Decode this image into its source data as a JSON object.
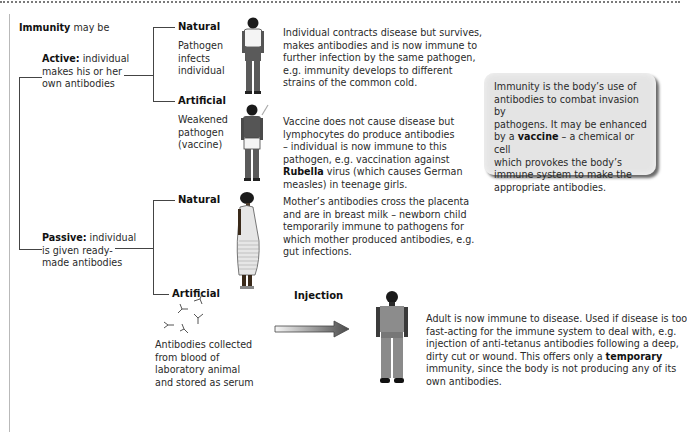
{
  "title": {
    "bold": "Immunity",
    "rest": " may be"
  },
  "active": {
    "bold": "Active:",
    "line1": " individual",
    "line2": "makes his or her",
    "line3": "own antibodies",
    "natural": {
      "label": "Natural",
      "caption": [
        "Pathogen",
        "infects",
        "individual"
      ],
      "description": [
        "Individual contracts disease but survives,",
        "makes antibodies and is now immune to",
        "further infection by the same pathogen,",
        "e.g. immunity develops to different",
        "strains of the common cold."
      ]
    },
    "artificial": {
      "label": "Artificial",
      "caption": [
        "Weakened",
        "pathogen",
        "(vaccine)"
      ],
      "description": [
        "Vaccine does not cause disease but",
        "lymphocytes do produce antibodies",
        "– individual is now immune to this",
        "pathogen, e.g. vaccination against"
      ],
      "description_bold": "Rubella",
      "description_after_bold": " virus (which causes German",
      "description_last": "measles) in teenage girls."
    }
  },
  "passive": {
    "bold": "Passive:",
    "line1": " individual",
    "line2": "is given ready-",
    "line3": "made antibodies",
    "natural": {
      "label": "Natural",
      "description": [
        "Mother’s antibodies cross the placenta",
        "and are in breast milk – newborn child",
        "temporarily immune to pathogens for",
        "which mother produced antibodies, e.g.",
        "gut infections."
      ]
    },
    "artificial": {
      "label": "Artificial",
      "caption": [
        "Antibodies collected",
        "from blood of",
        "laboratory animal",
        "and stored as serum"
      ],
      "arrow_label": "Injection",
      "description": [
        "Adult is now immune to disease. Used if disease is too",
        "fast-acting for the immune system to deal with, e.g.",
        "injection of anti-tetanus antibodies following a deep,"
      ],
      "description_pre_bold": "dirty cut or wound. This offers only a ",
      "description_bold": "temporary",
      "description_tail": [
        "immunity, since the body is not producing any of its",
        "own antibodies."
      ]
    }
  },
  "callout": {
    "line1": "Immunity is the body’s use of",
    "line2": "antibodies to combat invasion by",
    "line3": "pathogens. It may be enhanced",
    "line4_pre": "by a ",
    "line4_bold": "vaccine",
    "line4_post": " – a chemical or cell",
    "line5": "which provokes the body’s",
    "line6": "immune system to make the",
    "line7": "appropriate antibodies."
  },
  "icons": {
    "figure_natural_active": "standing-man-icon",
    "figure_vaccinated": "vaccinated-man-icon",
    "figure_pregnant": "pregnant-woman-icon",
    "antibodies": "antibody-y-shapes-icon",
    "arrow": "right-arrow-icon",
    "figure_adult": "standing-adult-icon"
  },
  "colors": {
    "callout_bg": "#e4e4e4",
    "line": "#444444",
    "figure": "#5a5a5a"
  }
}
